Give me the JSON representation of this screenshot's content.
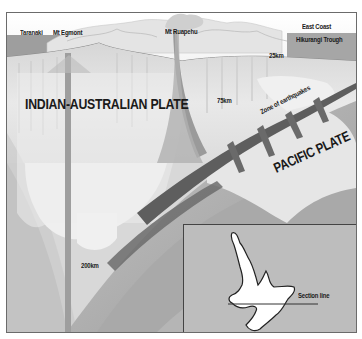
{
  "diagram": {
    "type": "geological cross-section",
    "labels": {
      "taranaki": "Taranaki",
      "mt_egmont": "Mt Egmont",
      "mt_ruapehu": "Mt Ruapehu",
      "east_coast": "East Coast",
      "hikurangi_trough": "Hikurangi Trough",
      "depth_25": "25km",
      "depth_75": "75km",
      "depth_200": "200km",
      "zone_of_earthquakes": "Zone of earthquakes",
      "indian_australian_plate": "INDIAN-AUSTRALIAN PLATE",
      "pacific_plate": "PACIFIC PLATE"
    },
    "inset_map": {
      "subject": "North Island of New Zealand outline",
      "section_line_label": "Section line"
    },
    "colors": {
      "background": "#ffffff",
      "crust_light": "#ececec",
      "mantle_mid": "#bdbdbd",
      "slab_dark": "#7a7a7a",
      "frame_border": "#6b6b6b"
    }
  }
}
